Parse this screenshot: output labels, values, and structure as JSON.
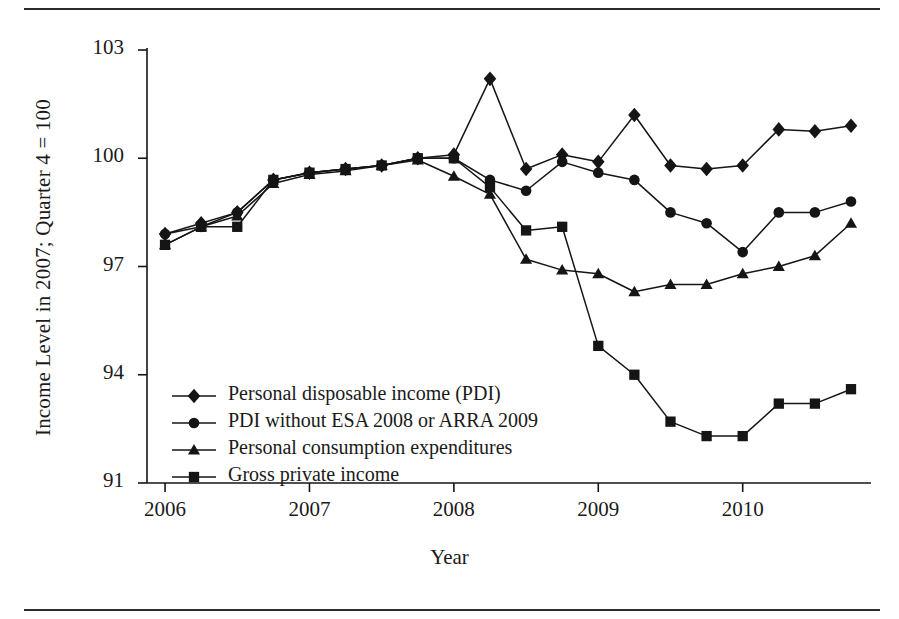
{
  "chart_data": {
    "type": "line",
    "title": "",
    "xlabel": "Year",
    "ylabel": "Income Level in 2007; Quarter 4 = 100",
    "xlim": [
      2005.875,
      2010.75
    ],
    "ylim": [
      91,
      103
    ],
    "yticks": [
      "91",
      "94",
      "97",
      "100",
      "103"
    ],
    "ytick_values": [
      91,
      94,
      97,
      100,
      103
    ],
    "xticks": [
      "2006",
      "2007",
      "2008",
      "2009",
      "2010"
    ],
    "xtick_values": [
      2006,
      2007,
      2008,
      2009,
      2010
    ],
    "grid": false,
    "legend_position": "inner lower-left",
    "x": [
      2006.0,
      2006.25,
      2006.5,
      2006.75,
      2007.0,
      2007.25,
      2007.5,
      2007.75,
      2008.0,
      2008.25,
      2008.5,
      2008.75,
      2009.0,
      2009.25,
      2009.5,
      2009.75,
      2010.0,
      2010.25,
      2010.5,
      2010.75
    ],
    "series": [
      {
        "name": "Personal disposable income (PDI)",
        "marker": "diamond",
        "values": [
          97.9,
          98.2,
          98.5,
          99.4,
          99.6,
          99.7,
          99.8,
          100.0,
          100.1,
          102.2,
          99.7,
          100.1,
          99.9,
          101.2,
          99.8,
          99.7,
          99.8,
          100.8,
          100.75,
          100.9
        ]
      },
      {
        "name": "PDI without ESA 2008 or ARRA 2009",
        "marker": "circle",
        "values": [
          97.9,
          98.1,
          98.5,
          99.4,
          99.6,
          99.7,
          99.8,
          100.0,
          100.0,
          99.4,
          99.1,
          99.9,
          99.6,
          99.4,
          98.5,
          98.2,
          97.4,
          98.5,
          98.5,
          98.8
        ]
      },
      {
        "name": "Personal consumption expenditures",
        "marker": "triangle",
        "values": [
          97.6,
          98.1,
          98.4,
          99.3,
          99.55,
          99.65,
          99.8,
          99.95,
          99.5,
          99.0,
          97.2,
          96.9,
          96.8,
          96.3,
          96.5,
          96.5,
          96.8,
          97.0,
          97.3,
          98.2
        ]
      },
      {
        "name": "Gross private income",
        "marker": "square",
        "values": [
          97.6,
          98.1,
          98.1,
          99.4,
          99.6,
          99.7,
          99.8,
          100.0,
          100.0,
          99.2,
          98.0,
          98.1,
          94.8,
          94.0,
          92.7,
          92.3,
          92.3,
          93.2,
          93.2,
          93.6
        ]
      }
    ]
  },
  "legend": {
    "entries": [
      "Personal disposable income (PDI)",
      "PDI without ESA 2008 or ARRA 2009",
      "Personal consumption expenditures",
      "Gross private income"
    ]
  },
  "style": {
    "ink": "#151515",
    "background": "#ffffff"
  }
}
